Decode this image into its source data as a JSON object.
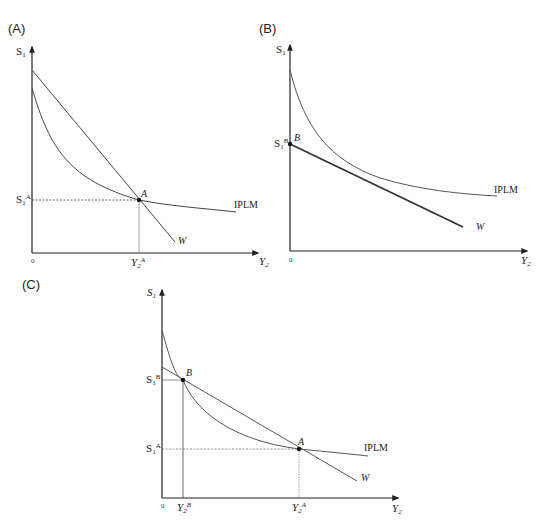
{
  "figure": {
    "panels": [
      {
        "id": "A",
        "label": "(A)",
        "y_axis_label": "S",
        "y_axis_sub": "1",
        "x_axis_label": "Y",
        "x_axis_sub": "2",
        "origin_label": "0",
        "curves": {
          "iplm": "IPLM",
          "w": "W"
        },
        "points": [
          {
            "name": "A",
            "y_label": "S",
            "y_sub": "1",
            "y_sup": "A",
            "x_label": "Y",
            "x_sub": "2",
            "x_sup": "A"
          }
        ]
      },
      {
        "id": "B",
        "label": "(B)",
        "y_axis_label": "S",
        "y_axis_sub": "1",
        "x_axis_label": "Y",
        "x_axis_sub": "2",
        "origin_label": "0",
        "curves": {
          "iplm": "IPLM",
          "w": "W"
        },
        "points": [
          {
            "name": "B",
            "y_label": "S",
            "y_sub": "1",
            "y_sup": "B"
          }
        ]
      },
      {
        "id": "C",
        "label": "(C)",
        "y_axis_label": "S",
        "y_axis_sub": "1",
        "x_axis_label": "Y",
        "x_axis_sub": "2",
        "origin_label": "0",
        "curves": {
          "iplm": "IPLM",
          "w": "W"
        },
        "points": [
          {
            "name": "B",
            "y_label": "S",
            "y_sub": "1",
            "y_sup": "B",
            "x_label": "Y",
            "x_sub": "2",
            "x_sup": "B"
          },
          {
            "name": "A",
            "y_label": "S",
            "y_sub": "1",
            "y_sup": "A",
            "x_label": "Y",
            "x_sub": "2",
            "x_sup": "A"
          }
        ]
      }
    ]
  }
}
